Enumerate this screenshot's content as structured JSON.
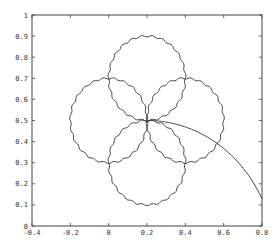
{
  "chart_data": {
    "type": "line",
    "title": "",
    "xlabel": "",
    "ylabel": "",
    "xlim": [
      -0.4,
      0.8
    ],
    "ylim": [
      0,
      1
    ],
    "grid": false,
    "x_ticks": [
      "-0.4",
      "-0.2",
      "0",
      "0.2",
      "0.4",
      "0.6",
      "0.8"
    ],
    "x_tick_values": [
      -0.4,
      -0.2,
      0,
      0.2,
      0.4,
      0.6,
      0.8
    ],
    "y_ticks": [
      "0",
      "0.1",
      "0.2",
      "0.3",
      "0.4",
      "0.5",
      "0.6",
      "0.7",
      "0.8",
      "0.9",
      "1"
    ],
    "y_tick_values": [
      0,
      0.1,
      0.2,
      0.3,
      0.4,
      0.5,
      0.6,
      0.7,
      0.8,
      0.9,
      1
    ],
    "series": [
      {
        "name": "circle-top",
        "shape": "circle",
        "center": [
          0.2,
          0.7
        ],
        "radius": 0.2
      },
      {
        "name": "circle-left",
        "shape": "circle",
        "center": [
          0.0,
          0.5
        ],
        "radius": 0.2
      },
      {
        "name": "circle-right",
        "shape": "circle",
        "center": [
          0.4,
          0.5
        ],
        "radius": 0.2
      },
      {
        "name": "circle-bottom",
        "shape": "circle",
        "center": [
          0.2,
          0.3
        ],
        "radius": 0.2
      },
      {
        "name": "trajectory-arc",
        "shape": "arc",
        "center": [
          0.2,
          -0.17
        ],
        "radius": 0.67,
        "x_range": [
          0.2,
          0.8
        ]
      }
    ],
    "line_color": "#333333"
  }
}
